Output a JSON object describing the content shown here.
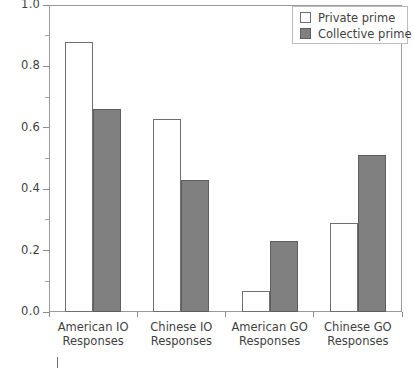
{
  "chart_data": {
    "type": "bar",
    "title": "",
    "subtitle": "",
    "xlabel": "",
    "ylabel": "",
    "ylim": [
      0.0,
      1.0
    ],
    "grid": false,
    "legend_position": "top-right",
    "categories": [
      "American IO Responses",
      "Chinese IO Responses",
      "American GO Responses",
      "Chinese GO Responses"
    ],
    "category_lines": [
      [
        "American IO",
        "Responses"
      ],
      [
        "Chinese IO",
        "Responses"
      ],
      [
        "American GO",
        "Responses"
      ],
      [
        "Chinese GO",
        "Responses"
      ]
    ],
    "series": [
      {
        "name": "Private prime",
        "color": "#ffffff",
        "edge_color": "#6f6f6f",
        "values": [
          0.88,
          0.63,
          0.07,
          0.29
        ]
      },
      {
        "name": "Collective prime",
        "color": "#808080",
        "edge_color": "#5e5e5e",
        "values": [
          0.66,
          0.43,
          0.23,
          0.51
        ]
      }
    ],
    "yticks": [
      0.0,
      0.2,
      0.4,
      0.6,
      0.8,
      1.0
    ],
    "ytick_labels": [
      "0.0",
      "0.2",
      "0.4",
      "0.6",
      "0.8",
      "1.0"
    ],
    "yticks_minor": [
      0.1,
      0.3,
      0.5,
      0.7,
      0.9
    ]
  },
  "legend": {
    "entries": [
      {
        "label": "Private prime"
      },
      {
        "label": "Collective prime"
      }
    ]
  },
  "colors": {
    "private_fill": "#ffffff",
    "collective_fill": "#808080",
    "axis": "#8d8d8d",
    "text": "#3f3f3f"
  }
}
